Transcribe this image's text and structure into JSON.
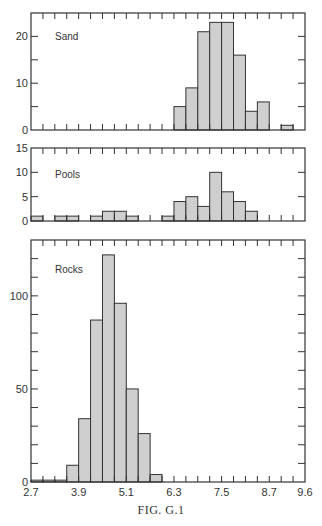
{
  "chart_data": {
    "type": "bar",
    "title": "",
    "caption": "FIG. G.1",
    "bin_width": 0.3,
    "xlim": [
      2.7,
      9.6
    ],
    "x_tick_labels": [
      "2.7",
      "3.9",
      "5.1",
      "6.3",
      "7.5",
      "8.7",
      "9.6"
    ],
    "x_tick_values": [
      2.7,
      3.9,
      5.1,
      6.3,
      7.5,
      8.7,
      9.6
    ],
    "bin_starts": [
      2.7,
      3.0,
      3.3,
      3.6,
      3.9,
      4.2,
      4.5,
      4.8,
      5.1,
      5.4,
      5.7,
      6.0,
      6.3,
      6.6,
      6.9,
      7.2,
      7.5,
      7.8,
      8.1,
      8.4,
      8.7,
      9.0,
      9.3
    ],
    "bar_color": "#cfcfcf",
    "edge_color": "#333333",
    "panels": [
      {
        "name": "Sand",
        "label": "Sand",
        "ylim": [
          0,
          25
        ],
        "y_tick_labels": [
          "0",
          "10",
          "20"
        ],
        "y_tick_values": [
          0,
          10,
          20
        ],
        "y_minor_step": 5,
        "values": [
          0,
          0,
          0,
          0,
          0,
          0,
          0,
          0,
          0,
          0,
          0,
          0,
          5,
          9,
          21,
          23,
          23,
          16,
          4,
          6,
          0,
          1,
          0
        ]
      },
      {
        "name": "Pools",
        "label": "Pools",
        "ylim": [
          0,
          15
        ],
        "y_tick_labels": [
          "0",
          "5",
          "10",
          "15"
        ],
        "y_tick_values": [
          0,
          5,
          10,
          15
        ],
        "y_minor_step": 5,
        "values": [
          1,
          0,
          1,
          1,
          0,
          1,
          2,
          2,
          1,
          0,
          0,
          1,
          4,
          5,
          3,
          10,
          6,
          4,
          2,
          0,
          0,
          0,
          0
        ]
      },
      {
        "name": "Rocks",
        "label": "Rocks",
        "ylim": [
          0,
          130
        ],
        "y_tick_labels": [
          "0",
          "50",
          "100"
        ],
        "y_tick_values": [
          0,
          50,
          100
        ],
        "y_minor_step": 10,
        "values": [
          1,
          1,
          1,
          9,
          34,
          87,
          122,
          96,
          50,
          26,
          4,
          0,
          0,
          0,
          0,
          0,
          0,
          0,
          0,
          0,
          0,
          0,
          0
        ]
      }
    ],
    "xlabel": "",
    "ylabel": "",
    "grid": false,
    "legend": "none"
  }
}
